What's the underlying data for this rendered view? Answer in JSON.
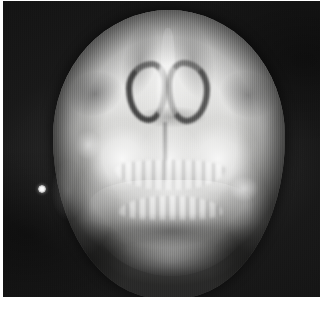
{
  "image": {
    "kind": "radiograph",
    "modality": "plain-film-x-ray",
    "view": "posteroanterior-facial-bones",
    "caption": "",
    "film": {
      "background_color": "#151515",
      "paper_color": "#ffffff",
      "bright_bone_color": "#ffffff",
      "soft_tissue_color": "#b9b9b7",
      "air_space_color": "#222222"
    },
    "collimation_field": {
      "shape": "circular",
      "center_x": 166,
      "center_y": 153,
      "radius_x": 116,
      "radius_y": 144
    },
    "marker": {
      "name": "radiopaque-side-marker",
      "shape": "bead",
      "center_x": 39,
      "center_y": 188,
      "diameter": 8,
      "color": "#ffffff"
    },
    "anatomy": [
      {
        "id": "frontal-bone",
        "label": "Frontal bone / calvarium"
      },
      {
        "id": "orbit-left",
        "label": "Left orbital rim"
      },
      {
        "id": "orbit-right",
        "label": "Right orbital rim"
      },
      {
        "id": "nasal-cavity-left",
        "label": "Left nasal cavity (air)"
      },
      {
        "id": "nasal-cavity-right",
        "label": "Right nasal cavity (air)"
      },
      {
        "id": "nasal-septum",
        "label": "Nasal septum"
      },
      {
        "id": "maxilla-left",
        "label": "Left maxilla / maxillary sinus"
      },
      {
        "id": "maxilla-right",
        "label": "Right maxilla / maxillary sinus"
      },
      {
        "id": "maxillary-teeth-row",
        "label": "Maxillary dentition"
      },
      {
        "id": "mandibular-teeth-row",
        "label": "Mandibular dentition"
      },
      {
        "id": "oral-airway",
        "label": "Oral airway"
      },
      {
        "id": "mandible-body",
        "label": "Mandible body"
      },
      {
        "id": "ramus-left",
        "label": "Left mandibular ramus"
      },
      {
        "id": "ramus-right",
        "label": "Right mandibular ramus"
      }
    ]
  }
}
